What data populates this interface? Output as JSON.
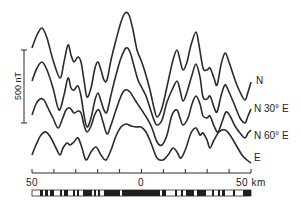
{
  "chart_data": {
    "type": "line",
    "title": "",
    "xlabel": "km",
    "ylabel": "nT",
    "x_ticks": [
      -50,
      -40,
      -30,
      -20,
      -10,
      0,
      10,
      20,
      30,
      40,
      50
    ],
    "x_tick_labels": [
      "50",
      "0",
      "50 km"
    ],
    "xlim": [
      -50,
      50
    ],
    "vertical_scale_bar": {
      "label": "500 nT",
      "value": 500
    },
    "grid": false,
    "legend_position": "right (labels at end of each curve)",
    "series": [
      {
        "name": "N",
        "points": [
          [
            32,
            48
          ],
          [
            37,
            35
          ],
          [
            42,
            28
          ],
          [
            47,
            38
          ],
          [
            53,
            60
          ],
          [
            60,
            78
          ],
          [
            64,
            62
          ],
          [
            68,
            45
          ],
          [
            71,
            55
          ],
          [
            74,
            62
          ],
          [
            78,
            57
          ],
          [
            81,
            62
          ],
          [
            84,
            80
          ],
          [
            87,
            97
          ],
          [
            91,
            88
          ],
          [
            95,
            68
          ],
          [
            98,
            62
          ],
          [
            101,
            70
          ],
          [
            104,
            80
          ],
          [
            107,
            80
          ],
          [
            111,
            60
          ],
          [
            116,
            40
          ],
          [
            121,
            22
          ],
          [
            125,
            13
          ],
          [
            129,
            15
          ],
          [
            133,
            30
          ],
          [
            137,
            50
          ],
          [
            141,
            60
          ],
          [
            145,
            72
          ],
          [
            150,
            90
          ],
          [
            154,
            108
          ],
          [
            157,
            117
          ],
          [
            162,
            108
          ],
          [
            168,
            82
          ],
          [
            173,
            60
          ],
          [
            177,
            50
          ],
          [
            180,
            60
          ],
          [
            183,
            70
          ],
          [
            187,
            62
          ],
          [
            191,
            45
          ],
          [
            196,
            32
          ],
          [
            199,
            45
          ],
          [
            203,
            68
          ],
          [
            207,
            70
          ],
          [
            210,
            68
          ],
          [
            214,
            78
          ],
          [
            217,
            85
          ],
          [
            221,
            65
          ],
          [
            225,
            53
          ],
          [
            229,
            62
          ],
          [
            235,
            80
          ],
          [
            240,
            92
          ],
          [
            245,
            100
          ],
          [
            248,
            92
          ],
          [
            251,
            82
          ]
        ]
      },
      {
        "name": "N 30° E",
        "points": [
          [
            32,
            81
          ],
          [
            37,
            68
          ],
          [
            42,
            62
          ],
          [
            47,
            70
          ],
          [
            53,
            88
          ],
          [
            59,
            110
          ],
          [
            64,
            95
          ],
          [
            68,
            78
          ],
          [
            71,
            88
          ],
          [
            74,
            90
          ],
          [
            78,
            86
          ],
          [
            81,
            96
          ],
          [
            84,
            115
          ],
          [
            87,
            127
          ],
          [
            91,
            118
          ],
          [
            95,
            100
          ],
          [
            98,
            93
          ],
          [
            101,
            101
          ],
          [
            104,
            110
          ],
          [
            107,
            112
          ],
          [
            111,
            95
          ],
          [
            116,
            75
          ],
          [
            121,
            58
          ],
          [
            126,
            48
          ],
          [
            130,
            52
          ],
          [
            134,
            66
          ],
          [
            138,
            80
          ],
          [
            142,
            88
          ],
          [
            146,
            96
          ],
          [
            150,
            108
          ],
          [
            154,
            120
          ],
          [
            157,
            125
          ],
          [
            162,
            120
          ],
          [
            167,
            102
          ],
          [
            172,
            90
          ],
          [
            177,
            81
          ],
          [
            180,
            90
          ],
          [
            183,
            101
          ],
          [
            187,
            92
          ],
          [
            192,
            75
          ],
          [
            196,
            64
          ],
          [
            200,
            77
          ],
          [
            203,
            97
          ],
          [
            207,
            99
          ],
          [
            210,
            96
          ],
          [
            214,
            107
          ],
          [
            217,
            112
          ],
          [
            221,
            96
          ],
          [
            225,
            85
          ],
          [
            229,
            92
          ],
          [
            235,
            106
          ],
          [
            240,
            118
          ],
          [
            245,
            123
          ],
          [
            248,
            116
          ],
          [
            251,
            109
          ]
        ]
      },
      {
        "name": "N 60° E",
        "points": [
          [
            32,
            115
          ],
          [
            36,
            104
          ],
          [
            40,
            99
          ],
          [
            44,
            100
          ],
          [
            48,
            108
          ],
          [
            53,
            118
          ],
          [
            58,
            128
          ],
          [
            62,
            120
          ],
          [
            66,
            110
          ],
          [
            70,
            108
          ],
          [
            74,
            113
          ],
          [
            78,
            111
          ],
          [
            81,
            113
          ],
          [
            84,
            125
          ],
          [
            87,
            132
          ],
          [
            91,
            126
          ],
          [
            95,
            114
          ],
          [
            99,
            110
          ],
          [
            103,
            122
          ],
          [
            107,
            134
          ],
          [
            111,
            125
          ],
          [
            116,
            110
          ],
          [
            121,
            96
          ],
          [
            125,
            90
          ],
          [
            130,
            92
          ],
          [
            135,
            100
          ],
          [
            139,
            106
          ],
          [
            143,
            112
          ],
          [
            148,
            120
          ],
          [
            152,
            128
          ],
          [
            157,
            142
          ],
          [
            162,
            145
          ],
          [
            167,
            135
          ],
          [
            172,
            115
          ],
          [
            177,
            110
          ],
          [
            180,
            118
          ],
          [
            183,
            125
          ],
          [
            188,
            118
          ],
          [
            192,
            104
          ],
          [
            196,
            96
          ],
          [
            200,
            104
          ],
          [
            203,
            116
          ],
          [
            207,
            118
          ],
          [
            210,
            116
          ],
          [
            214,
            126
          ],
          [
            218,
            132
          ],
          [
            222,
            122
          ],
          [
            226,
            112
          ],
          [
            230,
            116
          ],
          [
            235,
            126
          ],
          [
            240,
            133
          ],
          [
            245,
            138
          ],
          [
            248,
            133
          ],
          [
            251,
            130
          ]
        ]
      },
      {
        "name": "E",
        "points": [
          [
            32,
            155
          ],
          [
            36,
            145
          ],
          [
            41,
            135
          ],
          [
            46,
            132
          ],
          [
            51,
            138
          ],
          [
            56,
            148
          ],
          [
            60,
            155
          ],
          [
            63,
            148
          ],
          [
            67,
            143
          ],
          [
            70,
            145
          ],
          [
            74,
            142
          ],
          [
            78,
            138
          ],
          [
            82,
            148
          ],
          [
            86,
            160
          ],
          [
            91,
            152
          ],
          [
            96,
            147
          ],
          [
            101,
            155
          ],
          [
            106,
            160
          ],
          [
            111,
            150
          ],
          [
            116,
            136
          ],
          [
            121,
            127
          ],
          [
            126,
            124
          ],
          [
            131,
            126
          ],
          [
            136,
            127
          ],
          [
            141,
            127
          ],
          [
            146,
            132
          ],
          [
            151,
            143
          ],
          [
            157,
            158
          ],
          [
            163,
            160
          ],
          [
            168,
            155
          ],
          [
            173,
            148
          ],
          [
            177,
            152
          ],
          [
            181,
            158
          ],
          [
            186,
            148
          ],
          [
            191,
            133
          ],
          [
            196,
            128
          ],
          [
            200,
            135
          ],
          [
            203,
            133
          ],
          [
            207,
            140
          ],
          [
            210,
            148
          ],
          [
            214,
            140
          ],
          [
            219,
            132
          ],
          [
            225,
            130
          ],
          [
            230,
            135
          ],
          [
            236,
            145
          ],
          [
            242,
            155
          ],
          [
            247,
            160
          ],
          [
            251,
            163
          ]
        ]
      }
    ],
    "labels": {
      "N": "N",
      "N30E": "N 30° E",
      "N60E": "N 60° E",
      "E": "E"
    },
    "polarity_stripes": {
      "description": "black = normal polarity, white = reversed",
      "blocks": [
        [
          32,
          40,
          "w"
        ],
        [
          40,
          43,
          "b"
        ],
        [
          43,
          45,
          "w"
        ],
        [
          45,
          48,
          "b"
        ],
        [
          48,
          50,
          "w"
        ],
        [
          50,
          54,
          "b"
        ],
        [
          54,
          60,
          "w"
        ],
        [
          60,
          62,
          "b"
        ],
        [
          62,
          64,
          "w"
        ],
        [
          64,
          68,
          "b"
        ],
        [
          68,
          73,
          "w"
        ],
        [
          73,
          75,
          "b"
        ],
        [
          75,
          77,
          "w"
        ],
        [
          77,
          79,
          "b"
        ],
        [
          79,
          83,
          "w"
        ],
        [
          83,
          92,
          "b"
        ],
        [
          92,
          94,
          "w"
        ],
        [
          94,
          96,
          "b"
        ],
        [
          96,
          98,
          "w"
        ],
        [
          98,
          100,
          "b"
        ],
        [
          100,
          104,
          "w"
        ],
        [
          104,
          120,
          "b"
        ],
        [
          120,
          122,
          "w"
        ],
        [
          122,
          125,
          "b"
        ],
        [
          125,
          160,
          "b"
        ],
        [
          160,
          162,
          "w"
        ],
        [
          162,
          166,
          "b"
        ],
        [
          166,
          175,
          "w"
        ],
        [
          175,
          177,
          "b"
        ],
        [
          177,
          181,
          "w"
        ],
        [
          181,
          183,
          "b"
        ],
        [
          183,
          186,
          "w"
        ],
        [
          186,
          194,
          "b"
        ],
        [
          194,
          197,
          "w"
        ],
        [
          197,
          206,
          "b"
        ],
        [
          206,
          212,
          "w"
        ],
        [
          212,
          214,
          "b"
        ],
        [
          214,
          218,
          "w"
        ],
        [
          218,
          220,
          "b"
        ],
        [
          220,
          222,
          "w"
        ],
        [
          222,
          225,
          "b"
        ],
        [
          225,
          233,
          "w"
        ],
        [
          233,
          235,
          "b"
        ],
        [
          235,
          243,
          "w"
        ],
        [
          243,
          251,
          "b"
        ]
      ]
    }
  },
  "axis": {
    "left_label": "50",
    "center_label": "0",
    "right_label": "50 km"
  },
  "scale_bar": {
    "label": "500 nT"
  },
  "colors": {
    "line": "#2a2a2a",
    "background": "#ffffff"
  }
}
